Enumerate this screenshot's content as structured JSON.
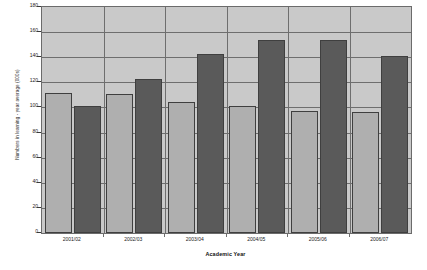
{
  "chart_data": {
    "type": "bar",
    "title": "",
    "xlabel": "Academic Year",
    "ylabel": "Numbers in learning - year average (000s)",
    "categories": [
      "2001/02",
      "2002/03",
      "2003/04",
      "2004/05",
      "2005/06",
      "2006/07"
    ],
    "series": [
      {
        "name": "series-1-light",
        "color": "#afafaf",
        "values": [
          111.5,
          110.5,
          104.5,
          101.0,
          97.5,
          96.0
        ]
      },
      {
        "name": "series-2-dark",
        "color": "#5a5a5a",
        "values": [
          101.5,
          122.5,
          142.5,
          153.5,
          153.5,
          141.0
        ]
      }
    ],
    "ylim": [
      0,
      180
    ],
    "y_ticks": [
      0,
      20,
      40,
      60,
      80,
      100,
      120,
      140,
      160,
      180
    ],
    "y_tick_labels": [
      "0",
      "20",
      "40",
      "60",
      "80",
      "100",
      "120",
      "140",
      "160",
      "180"
    ],
    "grid": {
      "horizontal": true,
      "vertical": true,
      "color": "#6e6e6e"
    },
    "legend": {
      "visible": false,
      "position": "none"
    },
    "plot_background": "#c9c9c9",
    "axis_color": "#6b6b6b"
  }
}
